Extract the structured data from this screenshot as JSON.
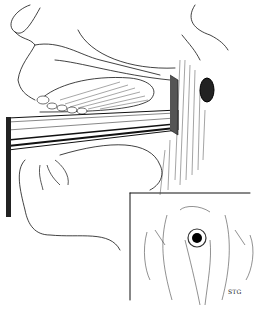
{
  "figure": {
    "type": "medical line illustration",
    "colors": {
      "ink": "#111111",
      "background": "#ffffff"
    }
  },
  "inset": {
    "frame": {
      "x": 130,
      "y": 193,
      "width": 120,
      "height": 107
    },
    "signature": "STG"
  }
}
